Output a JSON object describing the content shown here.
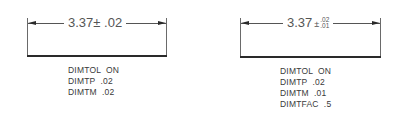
{
  "figures": [
    {
      "id": "symmetrical",
      "dimension": {
        "value": "3.37",
        "tolerance_symbol": "±",
        "tolerance": ".02"
      },
      "settings": [
        {
          "name": "DIMTOL",
          "value": "ON"
        },
        {
          "name": "DIMTP",
          "value": ".02"
        },
        {
          "name": "DIMTM",
          "value": ".02"
        }
      ]
    },
    {
      "id": "deviation",
      "dimension": {
        "value": "3.37",
        "tolerance_symbol": "±",
        "upper": ".02",
        "lower": ".01"
      },
      "settings": [
        {
          "name": "DIMTOL",
          "value": "ON"
        },
        {
          "name": "DIMTP",
          "value": ".02"
        },
        {
          "name": "DIMTM",
          "value": ".01"
        },
        {
          "name": "DIMTFAC",
          "value": ".5"
        }
      ]
    }
  ],
  "text": {
    "f1_dim": "3.37± .02",
    "f1_lines": [
      "DIMTOL  ON",
      "DIMTP  .02",
      "DIMTM  .02"
    ],
    "f2_value": "3.37",
    "f2_sym": "±",
    "f2_upper": ".02",
    "f2_lower": ".01",
    "f2_lines": [
      "DIMTOL  ON",
      "DIMTP  .02",
      "DIMTM  .01",
      "DIMTFAC  .5"
    ]
  },
  "colors": {
    "line": "#555555",
    "object_line": "#2a2a2a",
    "text": "#3a3a3a"
  }
}
